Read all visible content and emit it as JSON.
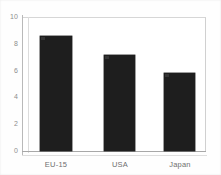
{
  "chart_data": {
    "type": "bar",
    "title": "",
    "subtitle": "",
    "xlabel": "",
    "ylabel": "",
    "categories": [
      "EU-15",
      "USA",
      "Japan"
    ],
    "values": [
      8.6,
      7.2,
      5.8
    ],
    "ylim": [
      0,
      10
    ],
    "yticks": [
      0,
      2,
      4,
      6,
      8,
      10
    ],
    "ytick_labels": [
      "0",
      "2",
      "4",
      "6",
      "8",
      "10"
    ],
    "grid": true,
    "legend": false,
    "legend_position": "none",
    "series": [
      {
        "name": "",
        "values": [
          8.6,
          7.2,
          5.8
        ]
      }
    ],
    "bar_color": "#1e1e1e",
    "gridline_color": "#e4e4e4",
    "axis_color": "#a8a8a8",
    "tick_label_color": "#8d8d8d",
    "category_label_color": "#6f6f6f",
    "background_color": "#ffffff"
  }
}
